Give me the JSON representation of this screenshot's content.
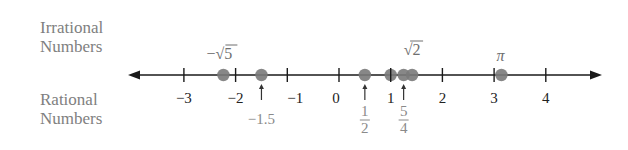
{
  "headings": {
    "irrational": [
      "Irrational",
      "Numbers"
    ],
    "rational": [
      "Rational",
      "Numbers"
    ]
  },
  "colors": {
    "axis": "#1a1a1a",
    "dot": "#7a7a7a",
    "irrational_text": "#6f6f6f",
    "rational_text": "#8a8a8a"
  },
  "chart_data": {
    "type": "number-line",
    "range": [
      -3,
      4
    ],
    "ticks": [
      -3,
      -2,
      -1,
      0,
      1,
      2,
      3,
      4
    ],
    "tick_labels": [
      "−3",
      "−2",
      "−1",
      "0",
      "1",
      "2",
      "3",
      "4"
    ],
    "irrational_points": [
      {
        "label": "−√5",
        "value": -2.236
      },
      {
        "label": "√2",
        "value": 1.414
      },
      {
        "label": "π",
        "value": 3.1416
      }
    ],
    "rational_points": [
      {
        "label": "−1.5",
        "value": -1.5
      },
      {
        "label": "1/2",
        "value": 0.5
      },
      {
        "label": "5/4",
        "value": 1.25
      },
      {
        "label": "1",
        "value": 1
      }
    ]
  }
}
